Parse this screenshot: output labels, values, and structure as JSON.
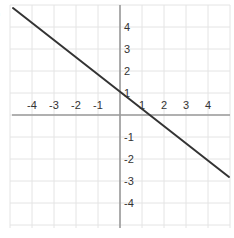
{
  "problem_label": ")",
  "chart_data": {
    "type": "line",
    "title": "",
    "xlabel": "",
    "ylabel": "",
    "xlim": [
      -5,
      5
    ],
    "ylim": [
      -5,
      5
    ],
    "grid": true,
    "x_tick_labels": [
      "-4",
      "-3",
      "-2",
      "-1",
      "1",
      "2",
      "3",
      "4"
    ],
    "y_tick_labels": [
      "4",
      "3",
      "2",
      "1",
      "-1",
      "-2",
      "-3",
      "-4"
    ],
    "x_ticks": [
      -4,
      -3,
      -2,
      -1,
      1,
      2,
      3,
      4
    ],
    "y_ticks": [
      4,
      3,
      2,
      1,
      -1,
      -2,
      -3,
      -4
    ],
    "series": [
      {
        "name": "line",
        "x": [
          -4.9,
          4.9
        ],
        "y": [
          4.8,
          -2.8
        ],
        "slope": -0.78,
        "y_intercept": 0.9
      }
    ],
    "colors": {
      "grid": "#e4e4e4",
      "axis": "#9a9a9a",
      "line": "#333333",
      "text": "#333333"
    }
  }
}
